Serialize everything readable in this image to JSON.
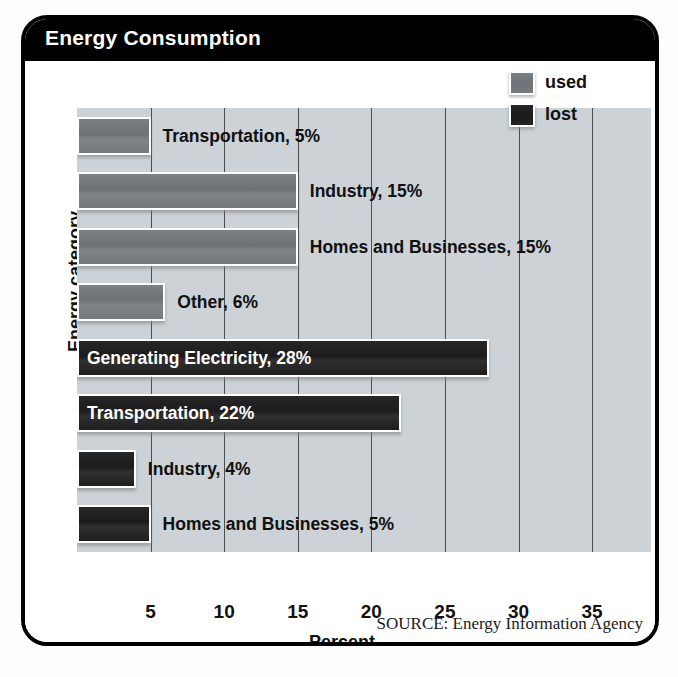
{
  "figure": {
    "title": "Energy Consumption",
    "source_note": "SOURCE: Energy Information Agency"
  },
  "legend": {
    "position": "top-right",
    "items": [
      {
        "label": "used",
        "swatch": "gray-swatch-icon",
        "color": "#76797d"
      },
      {
        "label": "lost",
        "swatch": "black-swatch-icon",
        "color": "#1f1f1f"
      }
    ]
  },
  "chart_data": {
    "type": "bar",
    "orientation": "horizontal",
    "title": "Energy Consumption",
    "xlabel": "Percent",
    "ylabel": "Energy category",
    "xlim": [
      0,
      39
    ],
    "xticks": [
      5,
      10,
      15,
      20,
      25,
      30,
      35
    ],
    "grid": true,
    "grid_axis": "x",
    "legend_entries": [
      "used",
      "lost"
    ],
    "categories": [
      "Transportation",
      "Industry",
      "Homes and Businesses",
      "Other",
      "Generating Electricity",
      "Transportation",
      "Industry",
      "Homes and Businesses"
    ],
    "series": [
      {
        "name": "used",
        "values": [
          5,
          15,
          15,
          6,
          null,
          null,
          null,
          null
        ]
      },
      {
        "name": "lost",
        "values": [
          null,
          null,
          null,
          null,
          28,
          22,
          4,
          5
        ]
      }
    ],
    "bars": [
      {
        "label": "Transportation, 5%",
        "category": "Transportation",
        "value": 5,
        "series": "used",
        "label_position": "outside"
      },
      {
        "label": "Industry, 15%",
        "category": "Industry",
        "value": 15,
        "series": "used",
        "label_position": "outside"
      },
      {
        "label": "Homes and Businesses, 15%",
        "category": "Homes and Businesses",
        "value": 15,
        "series": "used",
        "label_position": "outside"
      },
      {
        "label": "Other, 6%",
        "category": "Other",
        "value": 6,
        "series": "used",
        "label_position": "outside"
      },
      {
        "label": "Generating Electricity, 28%",
        "category": "Generating Electricity",
        "value": 28,
        "series": "lost",
        "label_position": "inside"
      },
      {
        "label": "Transportation, 22%",
        "category": "Transportation",
        "value": 22,
        "series": "lost",
        "label_position": "inside"
      },
      {
        "label": "Industry, 4%",
        "category": "Industry",
        "value": 4,
        "series": "lost",
        "label_position": "outside"
      },
      {
        "label": "Homes and Businesses, 5%",
        "category": "Homes and Businesses",
        "value": 5,
        "series": "lost",
        "label_position": "outside"
      }
    ],
    "annotations": [
      "SOURCE: Energy Information Agency"
    ]
  },
  "colors": {
    "frame": "#000000",
    "title_bar": "#000000",
    "title_text": "#ffffff",
    "plot_background": "#ccd2d6",
    "gridline": "#4a4f53",
    "bar_used": "#76797d",
    "bar_lost": "#1f1f1f",
    "axis_text": "#111111"
  }
}
